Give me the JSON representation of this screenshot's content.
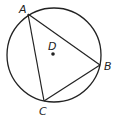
{
  "diagram": {
    "type": "circle-with-inscribed-triangle",
    "points": {
      "A": {
        "label": "A"
      },
      "B": {
        "label": "B"
      },
      "C": {
        "label": "C"
      },
      "D": {
        "label": "D"
      }
    },
    "segments": [
      "AB",
      "BC",
      "CA"
    ],
    "colors": {
      "stroke": "#222222",
      "background": "#ffffff"
    }
  }
}
